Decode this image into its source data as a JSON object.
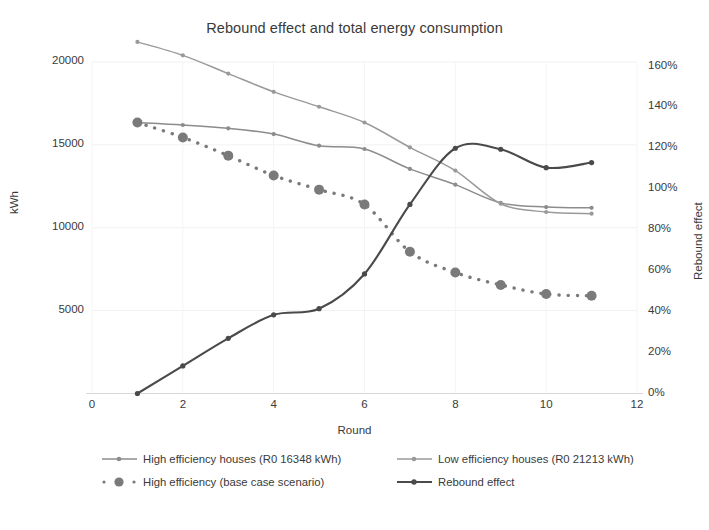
{
  "chart_data": {
    "type": "line",
    "title": "Rebound effect and total energy consumption",
    "xlabel": "Round",
    "ylabel": "kWh",
    "y2label": "Rebound effect",
    "x": [
      1,
      2,
      3,
      4,
      5,
      6,
      7,
      8,
      9,
      10,
      11
    ],
    "xlim": [
      0,
      12
    ],
    "ylim": [
      0,
      25000
    ],
    "y2lim": [
      0,
      1.6
    ],
    "xticks": [
      "0",
      "2",
      "4",
      "6",
      "8",
      "10",
      "12"
    ],
    "yticks": [
      "5000",
      "10000",
      "15000",
      "20000",
      "25000"
    ],
    "y2ticks": [
      "0%",
      "20%",
      "40%",
      "60%",
      "80%",
      "100%",
      "120%",
      "140%",
      "160%"
    ],
    "grid": false,
    "legend_position": "bottom",
    "series": [
      {
        "name": "High efficiency houses (R0 16348 kWh)",
        "axis": "left",
        "color": "#8c8c8c",
        "style": "solid",
        "marker": "small-diamond",
        "values": [
          16348,
          16200,
          16000,
          15650,
          14950,
          14750,
          13550,
          12600,
          11500,
          11250,
          11200
        ]
      },
      {
        "name": "Low efficiency houses (R0 21213 kWh)",
        "axis": "left",
        "color": "#9a9a9a",
        "style": "solid",
        "marker": "small-diamond",
        "values": [
          21213,
          20400,
          19300,
          18200,
          17300,
          16350,
          14850,
          13450,
          11450,
          10950,
          10850
        ]
      },
      {
        "name": "High efficiency (base case scenario)",
        "axis": "left",
        "color": "#7a7a7a",
        "style": "dotted",
        "marker": "large-circle",
        "values": [
          16348,
          15450,
          14350,
          13150,
          12300,
          11400,
          8550,
          7300,
          6550,
          6000,
          5900
        ]
      },
      {
        "name": "Rebound effect",
        "axis": "right",
        "color": "#4a4a4a",
        "style": "solid",
        "marker": "small-diamond",
        "values": [
          0.0,
          0.135,
          0.27,
          0.385,
          0.415,
          0.585,
          0.925,
          1.2,
          1.195,
          1.105,
          1.13
        ]
      }
    ]
  },
  "legend": [
    {
      "label": "High efficiency houses (R0 16348 kWh)",
      "style": "solid",
      "marker": "small-diamond",
      "color": "#8c8c8c"
    },
    {
      "label": "Low efficiency houses (R0 21213 kWh)",
      "style": "solid",
      "marker": "small-diamond",
      "color": "#9a9a9a"
    },
    {
      "label": "High efficiency (base case scenario)",
      "style": "dotted",
      "marker": "large-circle",
      "color": "#7a7a7a"
    },
    {
      "label": "Rebound effect",
      "style": "solid",
      "marker": "small-diamond",
      "color": "#4a4a4a"
    }
  ]
}
